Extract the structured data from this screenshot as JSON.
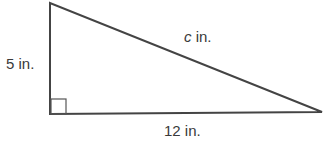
{
  "diagram": {
    "type": "right-triangle",
    "labels": {
      "height": "5 in.",
      "base": "12 in.",
      "hypotenuse_var": "c",
      "hypotenuse_unit": " in."
    },
    "vertices": {
      "top": [
        50,
        3
      ],
      "right_angle": [
        50,
        114
      ],
      "right": [
        322,
        112
      ]
    },
    "stroke_color": "#444444"
  }
}
